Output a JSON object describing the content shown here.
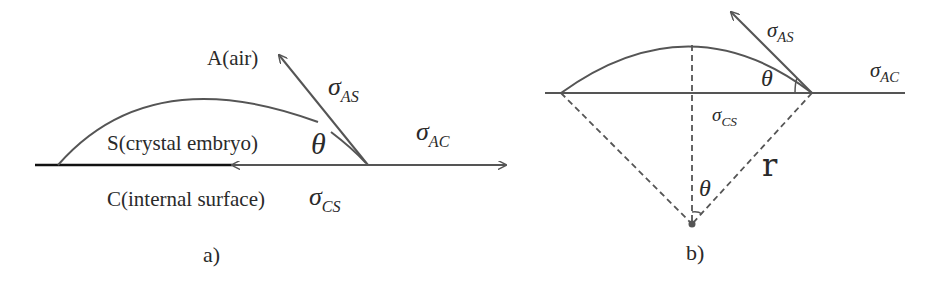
{
  "panel_a": {
    "caption": "a)",
    "air_label": "A(air)",
    "solid_label": "S(crystal embryo)",
    "surface_label": "C(internal surface)",
    "theta": "θ",
    "sigma": "σ",
    "sigma_as_sub": "AS",
    "sigma_ac_sub": "AC",
    "sigma_cs_sub": "CS"
  },
  "panel_b": {
    "caption": "b)",
    "theta_top": "θ",
    "theta_center": "θ",
    "radius_label": "r",
    "sigma": "σ",
    "sigma_as_sub": "AS",
    "sigma_ac_sub": "AC",
    "sigma_cs_sub": "CS"
  },
  "colors": {
    "line": "#555555",
    "base_dark": "#111111",
    "text": "#2a2a2a"
  }
}
